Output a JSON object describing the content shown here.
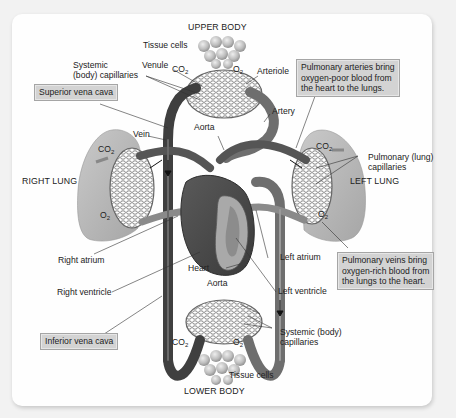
{
  "diagram": {
    "title_top": "UPPER BODY",
    "title_bottom": "LOWER BODY",
    "labels": {
      "tissue_cells_top": "Tissue cells",
      "tissue_cells_bottom": "Tissue cells",
      "systemic_capillaries_top": [
        "Systemic",
        "(body) capillaries"
      ],
      "venule": "Venule",
      "co2_top": "CO",
      "o2_top": "O",
      "arteriole": "Arteriole",
      "artery": "Artery",
      "aorta_top": "Aorta",
      "vein": "Vein",
      "right_lung": "RIGHT LUNG",
      "left_lung": "LEFT LUNG",
      "co2_right_lung": "CO",
      "o2_right_lung": "O",
      "co2_left_lung": "CO",
      "o2_left_lung": "O",
      "pulmonary_capillaries": [
        "Pulmonary (lung)",
        "capillaries"
      ],
      "right_atrium": "Right atrium",
      "right_ventricle": "Right ventricle",
      "heart": "Heart",
      "aorta_bottom": "Aorta",
      "left_atrium": "Left atrium",
      "left_ventricle": "Left ventricle",
      "systemic_capillaries_bottom": [
        "Systemic (body)",
        "capillaries"
      ],
      "co2_bottom": "CO",
      "o2_bottom": "O",
      "subscript_2": "2"
    },
    "boxes": {
      "superior_vena_cava": "Superior vena cava",
      "inferior_vena_cava": "Inferior vena cava",
      "pulmonary_arteries": [
        "Pulmonary arteries bring",
        "oxygen-poor blood from",
        "the heart to the lungs."
      ],
      "pulmonary_veins": [
        "Pulmonary veins bring",
        "oxygen-rich blood from",
        "the lungs to the heart."
      ]
    },
    "colors": {
      "panel_bg": "#fefefe",
      "page_bg": "#f2f2f2",
      "vessel_dark": "#4a4a4a",
      "vessel_mid": "#7a7a7a",
      "lung_fill": "#b5b5b5",
      "box_fill": "#d3d3d3"
    }
  }
}
